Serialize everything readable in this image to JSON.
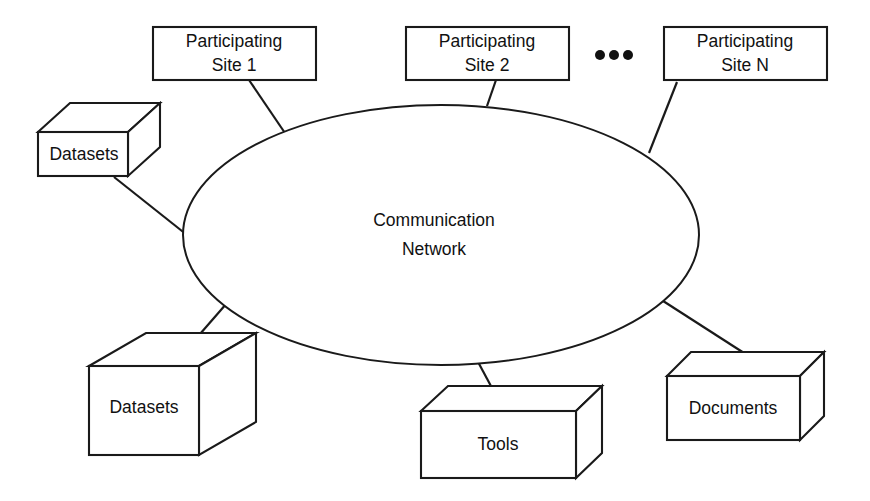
{
  "diagram": {
    "background_color": "#ffffff",
    "line_color": "#1a1a1a",
    "text_color": "#111111",
    "center": {
      "name": "communication-network",
      "shape": "ellipse",
      "label_line_1": "Communication",
      "label_line_2": "Network"
    },
    "sites": [
      {
        "name": "participating-site-1",
        "label_line_1": "Participating",
        "label_line_2": "Site 1"
      },
      {
        "name": "participating-site-2",
        "label_line_1": "Participating",
        "label_line_2": "Site 2"
      },
      {
        "name": "participating-site-n",
        "label_line_1": "Participating",
        "label_line_2": "Site N"
      }
    ],
    "ellipsis": "•••",
    "resources": [
      {
        "name": "datasets-top-left",
        "label": "Datasets",
        "shape": "cuboid"
      },
      {
        "name": "datasets-bottom-left",
        "label": "Datasets",
        "shape": "cuboid"
      },
      {
        "name": "tools",
        "label": "Tools",
        "shape": "cuboid"
      },
      {
        "name": "documents",
        "label": "Documents",
        "shape": "cuboid"
      }
    ],
    "connectors": [
      {
        "name": "connector-site-1",
        "from": "participating-site-1",
        "to": "communication-network"
      },
      {
        "name": "connector-site-2",
        "from": "participating-site-2",
        "to": "communication-network"
      },
      {
        "name": "connector-site-n",
        "from": "participating-site-n",
        "to": "communication-network"
      },
      {
        "name": "connector-datasets-top-left",
        "from": "datasets-top-left",
        "to": "communication-network"
      },
      {
        "name": "connector-datasets-bottom-left",
        "from": "datasets-bottom-left",
        "to": "communication-network"
      },
      {
        "name": "connector-tools",
        "from": "tools",
        "to": "communication-network"
      },
      {
        "name": "connector-documents",
        "from": "documents",
        "to": "communication-network"
      }
    ]
  }
}
